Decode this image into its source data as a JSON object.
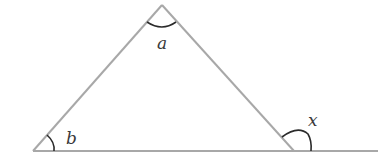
{
  "diagram": {
    "type": "triangle-exterior-angle",
    "colors": {
      "line": "#a8a8a8",
      "arc": "#2a2a2a",
      "label": "#3a3a3a",
      "background": "#ffffff"
    },
    "vertices": {
      "apex": [
        162,
        5
      ],
      "bottom_left": [
        33,
        151
      ],
      "bottom_right": [
        294,
        151
      ]
    },
    "baseline_end": [
      378,
      151
    ],
    "labels": {
      "apex_angle": "a",
      "bottom_left_angle": "b",
      "exterior_angle": "x"
    }
  }
}
